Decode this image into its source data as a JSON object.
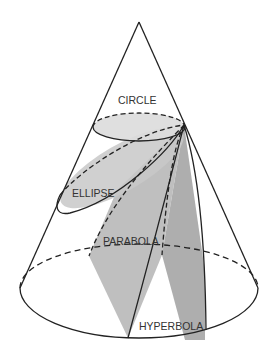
{
  "diagram": {
    "labels": {
      "circle": "CIRCLE",
      "ellipse": "ELLIPSE",
      "parabola": "PARABOLA",
      "hyperbola": "HYPERBOLA"
    },
    "colors": {
      "background": "#ffffff",
      "stroke": "#222222",
      "circle_fill": "#dcdcdc",
      "ellipse_fill": "#c8c8c8",
      "parabola_fill": "#b4b4b4",
      "hyperbola_fill": "#a0a0a0",
      "text": "#333333"
    }
  }
}
